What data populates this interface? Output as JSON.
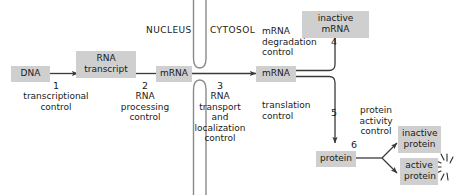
{
  "figure": {
    "background_color": "#ffffff",
    "chip_color": "#cfcfcf",
    "line_color": "#3a3a3a",
    "text_color": "#1a1a1a"
  },
  "compartments": {
    "nucleus": "NUCLEUS",
    "cytosol": "CYTOSOL"
  },
  "nodes": {
    "dna": "DNA",
    "rna_transcript": "RNA\ntranscript",
    "mrna_nuclear": "mRNA",
    "mrna_cytosolic": "mRNA",
    "inactive_mrna": "inactive mRNA",
    "protein": "protein",
    "inactive_protein": "inactive\nprotein",
    "active_protein": "active\nprotein"
  },
  "steps": [
    {
      "number": "1",
      "label": "transcriptional\ncontrol"
    },
    {
      "number": "2",
      "label": "RNA\nprocessing\ncontrol"
    },
    {
      "number": "3",
      "label": "RNA\ntransport\nand\nlocalization\ncontrol"
    },
    {
      "number": "4",
      "label": "mRNA\ndegradation\ncontrol"
    },
    {
      "number": "5",
      "label": "translation\ncontrol"
    },
    {
      "number": "6",
      "label": "protein\nactivity\ncontrol"
    }
  ],
  "icons": {
    "nuclear_envelope": "nuclear-envelope-pore",
    "activity_burst": "activity-burst-icon"
  }
}
